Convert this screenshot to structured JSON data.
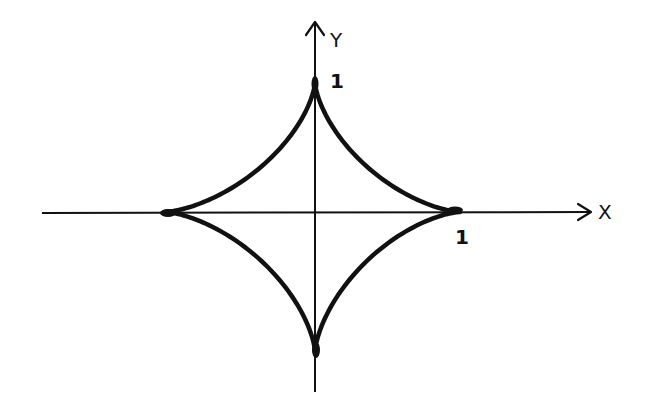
{
  "diagram": {
    "curve": "x^(2/3) + y^(2/3) = 1",
    "axes": {
      "x_label": "X",
      "y_label": "Y"
    },
    "tick_labels": {
      "x_one": "1",
      "y_one": "1"
    },
    "colors": {
      "ink": "#111111",
      "background": "#ffffff"
    }
  }
}
